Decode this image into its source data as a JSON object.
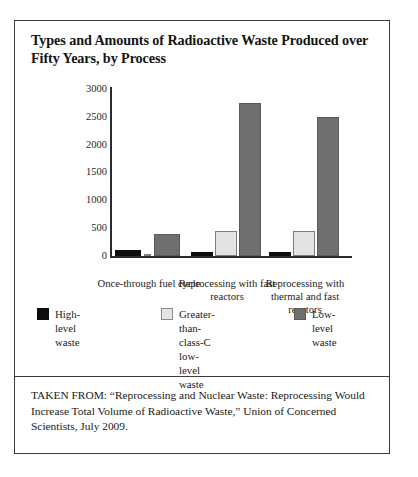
{
  "figure": {
    "title": "Types and Amounts of Radioactive Waste Produced over Fifty Years, by Process",
    "source_note": "TAKEN FROM: “Reprocessing and Nuclear Waste: Reprocessing Would Increase Total Volume of Radioactive Waste,” Union of Concerned Scientists, July 2009."
  },
  "chart_data": {
    "type": "bar",
    "title": "Types and Amounts of Radioactive Waste Produced over Fifty Years, by Process",
    "xlabel": "",
    "ylabel": "",
    "ylim": [
      0,
      3000
    ],
    "yticks": [
      0,
      500,
      1000,
      1500,
      2000,
      2500,
      3000
    ],
    "ytick_labels": [
      "0",
      "500",
      "1000",
      "1500",
      "2000",
      "2500",
      "3000"
    ],
    "grid": false,
    "legend_position": "bottom",
    "categories": [
      "Once-through\nfuel cycle",
      "Reprocessing\nwith fast\nreactors",
      "Reprocessing\nwith thermal and\nfast reactors"
    ],
    "series": [
      {
        "name": "High-level waste",
        "color": "#0d0d0d",
        "values": [
          105,
          80,
          75
        ]
      },
      {
        "name": "Greater-than-class-C\nlow-level waste",
        "color": "#e4e4e4",
        "values": [
          25,
          450,
          450
        ]
      },
      {
        "name": "Low-level waste",
        "color": "#6f6f6f",
        "values": [
          400,
          2750,
          2500
        ]
      }
    ]
  },
  "colors": {
    "high_level_waste": "#0d0d0d",
    "gtcc_low_level_waste": "#e4e4e4",
    "low_level_waste": "#6f6f6f",
    "frame_border": "#3b3b3b",
    "axis": "#2b2b2b"
  }
}
